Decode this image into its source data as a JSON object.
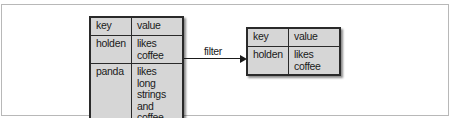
{
  "diagram": {
    "source_table": {
      "rows": [
        {
          "key": "key",
          "value": "value"
        },
        {
          "key": "holden",
          "value": "likes coffee"
        },
        {
          "key": "panda",
          "value": "likes long strings and coffee"
        }
      ]
    },
    "operation": {
      "label": "filter"
    },
    "result_table": {
      "rows": [
        {
          "key": "key",
          "value": "value"
        },
        {
          "key": "holden",
          "value": "likes coffee"
        }
      ]
    },
    "colors": {
      "cell_fill": "#d6d6d6",
      "border": "#2a2a2a",
      "frame": "#b8b8b8"
    }
  }
}
